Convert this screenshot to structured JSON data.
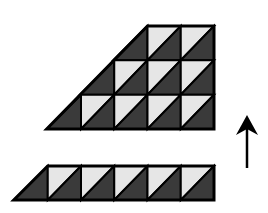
{
  "diagram": {
    "colors": {
      "background": "#ffffff",
      "dark": "#3a3a3a",
      "light": "#e6e6e6",
      "stroke": "#000000"
    },
    "cell_size": 33.25,
    "upper_figure": {
      "right_x": 214,
      "rows": [
        {
          "top_y": 26,
          "bottom_y": 60.3,
          "cells": 2
        },
        {
          "top_y": 60.3,
          "bottom_y": 94.7,
          "cells": 3
        },
        {
          "top_y": 94.7,
          "bottom_y": 129,
          "cells": 4
        }
      ]
    },
    "lower_strip": {
      "right_x": 214,
      "top_y": 166,
      "bottom_y": 200,
      "cells": 5
    },
    "arrow": {
      "x": 247,
      "y_start": 168,
      "y_end": 115,
      "direction": "up"
    }
  }
}
